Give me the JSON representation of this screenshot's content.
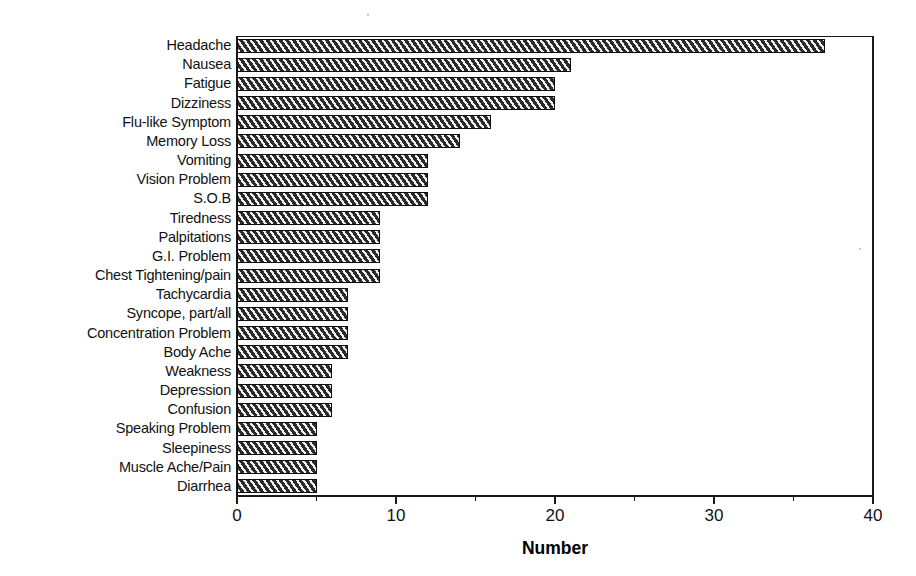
{
  "chart_data": {
    "type": "bar",
    "orientation": "horizontal",
    "title": "",
    "xlabel": "Number",
    "ylabel": "",
    "xlim": [
      0,
      40
    ],
    "xticks": [
      0,
      10,
      20,
      30,
      40
    ],
    "xtick_labels": [
      "0",
      "10",
      "20",
      "30",
      "40"
    ],
    "minor_xticks": [
      5,
      15,
      25,
      35
    ],
    "grid": false,
    "legend": null,
    "bar_style": "diagonal-hatch-dark",
    "categories": [
      "Headache",
      "Nausea",
      "Fatigue",
      "Dizziness",
      "Flu-like Symptom",
      "Memory Loss",
      "Vomiting",
      "Vision Problem",
      "S.O.B",
      "Tiredness",
      "Palpitations",
      "G.I. Problem",
      "Chest Tightening/pain",
      "Tachycardia",
      "Syncope, part/all",
      "Concentration Problem",
      "Body Ache",
      "Weakness",
      "Depression",
      "Confusion",
      "Speaking Problem",
      "Sleepiness",
      "Muscle Ache/Pain",
      "Diarrhea"
    ],
    "values": [
      37,
      21,
      20,
      20,
      16,
      14,
      12,
      12,
      12,
      9,
      9,
      9,
      9,
      7,
      7,
      7,
      7,
      6,
      6,
      6,
      5,
      5,
      5,
      5
    ]
  },
  "colors": {
    "axis": "#1a1a1a",
    "bar_fill": "#3d3d3d",
    "bar_hatch": "#f2f2f2",
    "text": "#111111",
    "background": "#ffffff"
  }
}
